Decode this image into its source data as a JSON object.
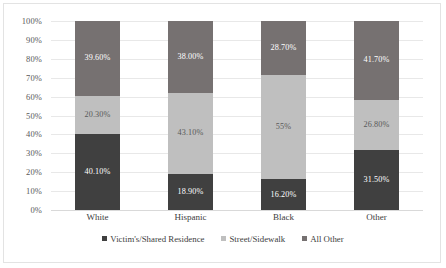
{
  "chart_data": {
    "type": "bar",
    "variant": "stacked-100",
    "title": "",
    "subtitle": "",
    "xlabel": "",
    "ylabel": "",
    "categories": [
      "White",
      "Hispanic",
      "Black",
      "Other"
    ],
    "series": [
      {
        "name": "Victim's/Shared Residence",
        "color": "#404040",
        "values": [
          40.1,
          18.9,
          16.2,
          31.5
        ],
        "labels": [
          "40.10%",
          "18.90%",
          "16.20%",
          "31.50%"
        ]
      },
      {
        "name": "Street/Sidewalk",
        "color": "#bfbfbf",
        "values": [
          20.3,
          43.1,
          55.0,
          26.8
        ],
        "labels": [
          "20.30%",
          "43.10%",
          "55%",
          "26.80%"
        ]
      },
      {
        "name": "All Other",
        "color": "#767171",
        "values": [
          39.6,
          38.0,
          28.7,
          41.7
        ],
        "labels": [
          "39.60%",
          "38.00%",
          "28.70%",
          "41.70%"
        ]
      }
    ],
    "ylim": [
      0,
      100
    ],
    "yticks": [
      "0%",
      "10%",
      "20%",
      "30%",
      "40%",
      "50%",
      "60%",
      "70%",
      "80%",
      "90%",
      "100%"
    ],
    "ytick_values": [
      0,
      10,
      20,
      30,
      40,
      50,
      60,
      70,
      80,
      90,
      100
    ],
    "grid": true,
    "grid_axis": "y",
    "legend": true,
    "legend_position": "bottom",
    "colors": {
      "series_1": "#404040",
      "series_2": "#bfbfbf",
      "series_3": "#767171",
      "gridline": "#e8e8e8",
      "border": "#e3e3e3",
      "axis_text": "#595959",
      "category_text": "#404040"
    }
  }
}
